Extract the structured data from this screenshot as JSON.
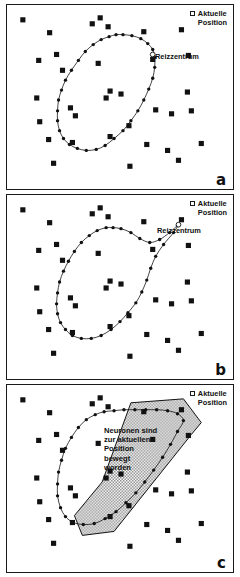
{
  "figure": {
    "width": 240,
    "height": 577,
    "background": "#ffffff",
    "ink_color": "#111111",
    "shade_color": "#8c8c8c"
  },
  "legend": {
    "marker_icon": "open-square-marker",
    "label": "Aktuelle\nPosition"
  },
  "labels": {
    "stimulus_center": "Reizzentrum",
    "annotation": "Neuronen sind\nzur aktuellen\nPosition\nbewegt\nworden"
  },
  "panels": [
    {
      "id": "a",
      "label": "a"
    },
    {
      "id": "b",
      "label": "b"
    },
    {
      "id": "c",
      "label": "c"
    }
  ],
  "chart_data": {
    "type": "scatter",
    "xlabel": "",
    "ylabel": "",
    "xlim": [
      0,
      228
    ],
    "ylim": [
      0,
      186
    ],
    "grid": false,
    "legend_position": "top-right",
    "legend_entries": [
      "Aktuelle Position"
    ],
    "series": [
      {
        "name": "Aktuelle Position (panel a)",
        "panel": "a",
        "marker": "filled-square",
        "points": [
          [
            16,
            15
          ],
          [
            43,
            28
          ],
          [
            86,
            19
          ],
          [
            94,
            13
          ],
          [
            102,
            22
          ],
          [
            138,
            27
          ],
          [
            176,
            25
          ],
          [
            32,
            56
          ],
          [
            50,
            50
          ],
          [
            56,
            66
          ],
          [
            92,
            59
          ],
          [
            147,
            55
          ],
          [
            183,
            51
          ],
          [
            30,
            94
          ],
          [
            64,
            104
          ],
          [
            182,
            88
          ],
          [
            100,
            94
          ],
          [
            104,
            87
          ],
          [
            115,
            90
          ],
          [
            69,
            112
          ],
          [
            33,
            118
          ],
          [
            123,
            122
          ],
          [
            150,
            106
          ],
          [
            166,
            110
          ],
          [
            186,
            107
          ],
          [
            42,
            136
          ],
          [
            66,
            139
          ],
          [
            104,
            133
          ],
          [
            141,
            141
          ],
          [
            162,
            147
          ],
          [
            47,
            160
          ],
          [
            124,
            163
          ],
          [
            173,
            157
          ],
          [
            196,
            140
          ]
        ]
      },
      {
        "name": "Neuronen-Ring (panel a)",
        "panel": "a",
        "marker": "small-filled-circle",
        "closed_curve": true,
        "points": [
          [
            103,
            32
          ],
          [
            95,
            35
          ],
          [
            87,
            40
          ],
          [
            79,
            47
          ],
          [
            72,
            56
          ],
          [
            65,
            66
          ],
          [
            59,
            76
          ],
          [
            55,
            86
          ],
          [
            52,
            96
          ],
          [
            51,
            107
          ],
          [
            51,
            117
          ],
          [
            53,
            127
          ],
          [
            57,
            135
          ],
          [
            63,
            141
          ],
          [
            71,
            145
          ],
          [
            80,
            147
          ],
          [
            90,
            146
          ],
          [
            99,
            142
          ],
          [
            108,
            135
          ],
          [
            117,
            127
          ],
          [
            125,
            117
          ],
          [
            132,
            107
          ],
          [
            138,
            96
          ],
          [
            143,
            85
          ],
          [
            147,
            74
          ],
          [
            149,
            63
          ],
          [
            149,
            53
          ],
          [
            147,
            45
          ],
          [
            142,
            39
          ],
          [
            135,
            34
          ],
          [
            126,
            31
          ],
          [
            117,
            30
          ],
          [
            110,
            30
          ]
        ]
      },
      {
        "name": "Reizzentrum (panel a)",
        "panel": "a",
        "marker": "open-circle",
        "points": [
          [
            147,
            50
          ]
        ]
      },
      {
        "name": "Aktuelle Position (panel b)",
        "panel": "b",
        "marker": "filled-square",
        "points": [
          [
            16,
            15
          ],
          [
            43,
            28
          ],
          [
            86,
            19
          ],
          [
            94,
            13
          ],
          [
            102,
            22
          ],
          [
            138,
            27
          ],
          [
            176,
            25
          ],
          [
            32,
            56
          ],
          [
            50,
            50
          ],
          [
            56,
            66
          ],
          [
            92,
            59
          ],
          [
            147,
            55
          ],
          [
            183,
            51
          ],
          [
            30,
            94
          ],
          [
            64,
            104
          ],
          [
            182,
            88
          ],
          [
            100,
            94
          ],
          [
            104,
            87
          ],
          [
            115,
            90
          ],
          [
            69,
            112
          ],
          [
            33,
            118
          ],
          [
            123,
            122
          ],
          [
            150,
            106
          ],
          [
            166,
            110
          ],
          [
            186,
            107
          ],
          [
            42,
            136
          ],
          [
            66,
            139
          ],
          [
            104,
            133
          ],
          [
            141,
            141
          ],
          [
            162,
            147
          ],
          [
            47,
            160
          ],
          [
            124,
            163
          ],
          [
            173,
            157
          ],
          [
            196,
            140
          ]
        ]
      },
      {
        "name": "Neuronen-Ring (panel b)",
        "panel": "b",
        "marker": "small-filled-circle",
        "closed_curve": true,
        "points": [
          [
            100,
            33
          ],
          [
            91,
            36
          ],
          [
            83,
            41
          ],
          [
            75,
            48
          ],
          [
            68,
            57
          ],
          [
            62,
            67
          ],
          [
            57,
            77
          ],
          [
            53,
            88
          ],
          [
            51,
            99
          ],
          [
            50,
            110
          ],
          [
            51,
            120
          ],
          [
            54,
            129
          ],
          [
            59,
            136
          ],
          [
            66,
            142
          ],
          [
            75,
            145
          ],
          [
            85,
            145
          ],
          [
            95,
            142
          ],
          [
            105,
            136
          ],
          [
            114,
            128
          ],
          [
            122,
            119
          ],
          [
            130,
            109
          ],
          [
            136,
            98
          ],
          [
            141,
            86
          ],
          [
            145,
            74
          ],
          [
            150,
            62
          ],
          [
            158,
            50
          ],
          [
            168,
            38
          ],
          [
            172,
            31
          ],
          [
            164,
            38
          ],
          [
            154,
            45
          ],
          [
            144,
            48
          ],
          [
            134,
            44
          ],
          [
            125,
            38
          ],
          [
            115,
            34
          ],
          [
            107,
            33
          ]
        ]
      },
      {
        "name": "Reizzentrum (panel b)",
        "panel": "b",
        "marker": "open-circle",
        "points": [
          [
            173,
            30
          ]
        ]
      },
      {
        "name": "Aktuelle Position (panel c)",
        "panel": "c",
        "marker": "filled-square",
        "points": [
          [
            16,
            15
          ],
          [
            43,
            28
          ],
          [
            86,
            19
          ],
          [
            94,
            13
          ],
          [
            102,
            22
          ],
          [
            138,
            27
          ],
          [
            176,
            25
          ],
          [
            32,
            56
          ],
          [
            50,
            50
          ],
          [
            56,
            66
          ],
          [
            92,
            59
          ],
          [
            147,
            55
          ],
          [
            183,
            51
          ],
          [
            30,
            94
          ],
          [
            64,
            104
          ],
          [
            182,
            88
          ],
          [
            100,
            94
          ],
          [
            104,
            87
          ],
          [
            115,
            90
          ],
          [
            69,
            112
          ],
          [
            33,
            118
          ],
          [
            123,
            122
          ],
          [
            150,
            106
          ],
          [
            166,
            110
          ],
          [
            186,
            107
          ],
          [
            42,
            136
          ],
          [
            66,
            139
          ],
          [
            104,
            133
          ],
          [
            141,
            141
          ],
          [
            162,
            147
          ],
          [
            47,
            160
          ],
          [
            124,
            163
          ],
          [
            173,
            157
          ],
          [
            196,
            140
          ]
        ]
      },
      {
        "name": "Neuronen-Ring (panel c)",
        "panel": "c",
        "marker": "small-filled-circle",
        "closed_curve": true,
        "points": [
          [
            98,
            27
          ],
          [
            89,
            30
          ],
          [
            80,
            35
          ],
          [
            72,
            43
          ],
          [
            65,
            53
          ],
          [
            59,
            64
          ],
          [
            55,
            76
          ],
          [
            52,
            88
          ],
          [
            51,
            100
          ],
          [
            51,
            112
          ],
          [
            54,
            124
          ],
          [
            59,
            133
          ],
          [
            67,
            139
          ],
          [
            77,
            141
          ],
          [
            88,
            140
          ],
          [
            99,
            135
          ],
          [
            110,
            128
          ],
          [
            120,
            119
          ],
          [
            130,
            109
          ],
          [
            139,
            98
          ],
          [
            148,
            86
          ],
          [
            157,
            73
          ],
          [
            165,
            60
          ],
          [
            172,
            47
          ],
          [
            178,
            36
          ],
          [
            172,
            29
          ],
          [
            162,
            26
          ],
          [
            151,
            25
          ],
          [
            140,
            25
          ],
          [
            129,
            25
          ],
          [
            118,
            25
          ],
          [
            108,
            26
          ]
        ]
      },
      {
        "name": "Bewegungsbereich-Polygon (panel c)",
        "panel": "c",
        "marker": "shaded-polygon",
        "fill": "checker-gray",
        "points": [
          [
            125,
            18
          ],
          [
            178,
            14
          ],
          [
            196,
            38
          ],
          [
            186,
            50
          ],
          [
            108,
            148
          ],
          [
            76,
            152
          ],
          [
            68,
            132
          ],
          [
            96,
            98
          ]
        ]
      }
    ]
  }
}
